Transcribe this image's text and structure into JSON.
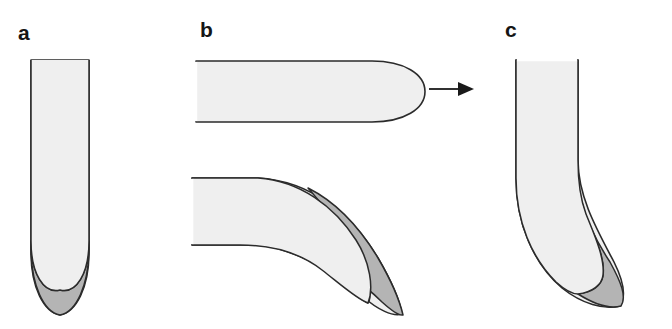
{
  "figure": {
    "caption_labels": [
      "a",
      "b",
      "c"
    ],
    "background_color": "#ffffff",
    "outline_color": "#2b2b2b",
    "fill_light": "#efefef",
    "fill_dark": "#b4b4b4",
    "arrow_color": "#1a1a1a"
  },
  "panels": [
    {
      "id": "a",
      "label": "a",
      "description": "straight vertical tube with rounded tip and dark crescent at tip",
      "orientation": "vertical",
      "has_dark_region": true
    },
    {
      "id": "b",
      "label": "b",
      "description": "upper horizontal tube with rounded right tip and lower tube bending downward with dark crescent on outer curve",
      "orientation": "horizontal",
      "has_dark_region": true,
      "sub_shapes": [
        "straight-horizontal-tube",
        "bent-tube-with-crescent"
      ],
      "arrow": {
        "name": "transition-arrow",
        "direction": "right"
      }
    },
    {
      "id": "c",
      "label": "c",
      "description": "vertical tube bending to the right and downward with dark crescent on outer right side of bend",
      "orientation": "vertical-bent",
      "has_dark_region": true
    }
  ]
}
